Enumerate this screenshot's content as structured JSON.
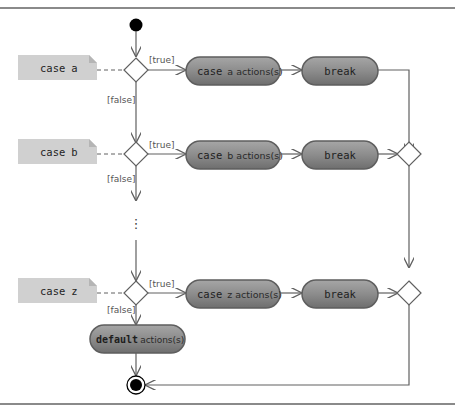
{
  "diagram": {
    "type": "UML activity diagram",
    "colors": {
      "note_fill": "#d0d0d0",
      "note_fold": "#b8b8b8",
      "action_fill": "#8c8c8c",
      "action_border": "#5e5e5e",
      "action_highlight": "#a8a8a8",
      "line": "#606060",
      "node_fill": "#000000",
      "frame": "#8a8a8a"
    },
    "initial_node": {
      "label": ""
    },
    "cases": [
      {
        "note": {
          "keyword": "case",
          "value": "a"
        },
        "guard_true": "[true]",
        "guard_false": "[false]",
        "action": {
          "keyword": "case",
          "rest": "a actions(s)"
        },
        "break_label": "break"
      },
      {
        "note": {
          "keyword": "case",
          "value": "b"
        },
        "guard_true": "[true]",
        "guard_false": "[false]",
        "action": {
          "keyword": "case",
          "rest": "b actions(s)"
        },
        "break_label": "break"
      },
      {
        "note": {
          "keyword": "case",
          "value": "z"
        },
        "guard_true": "[true]",
        "guard_false": "[false]",
        "action": {
          "keyword": "case",
          "rest": "z actions(s)"
        },
        "break_label": "break"
      }
    ],
    "ellipsis": "⋮",
    "default_action": {
      "keyword": "default",
      "rest": "actions(s)"
    },
    "final_node": {
      "label": ""
    }
  }
}
